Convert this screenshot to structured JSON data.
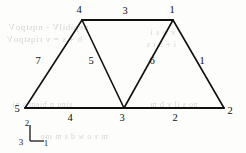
{
  "figure": {
    "background_color": "#fdfdfc",
    "line_color": "#111111",
    "text_color": "#0d0d0d"
  },
  "nodes": [
    {
      "label": "4",
      "x": 82,
      "y": 20,
      "label_x": 79,
      "label_y": 13
    },
    {
      "label": "1",
      "x": 173,
      "y": 20,
      "label_x": 172,
      "label_y": 13
    },
    {
      "label": "5",
      "x": 25,
      "y": 108,
      "label_x": 17,
      "label_y": 112
    },
    {
      "label": "3",
      "x": 124,
      "y": 108,
      "label_x": 122,
      "label_y": 121
    },
    {
      "label": "2",
      "x": 224,
      "y": 108,
      "label_x": 230,
      "label_y": 114
    }
  ],
  "members": [
    {
      "label": "3",
      "from": "4",
      "to": "1",
      "x1": 82,
      "y1": 20,
      "x2": 173,
      "y2": 20,
      "label_x": 125,
      "label_y": 14
    },
    {
      "label": "7",
      "from": "5",
      "to": "4",
      "x1": 25,
      "y1": 108,
      "x2": 82,
      "y2": 20,
      "label_x": 38,
      "label_y": 64
    },
    {
      "label": "5",
      "from": "4",
      "to": "3",
      "x1": 82,
      "y1": 20,
      "x2": 124,
      "y2": 108,
      "label_x": 91,
      "label_y": 64
    },
    {
      "label": "6",
      "from": "3",
      "to": "1",
      "x1": 124,
      "y1": 108,
      "x2": 173,
      "y2": 20,
      "label_x": 152,
      "label_y": 64
    },
    {
      "label": "1",
      "from": "1",
      "to": "2",
      "x1": 173,
      "y1": 20,
      "x2": 224,
      "y2": 108,
      "label_x": 202,
      "label_y": 64
    },
    {
      "label": "4",
      "from": "5",
      "to": "3",
      "x1": 25,
      "y1": 108,
      "x2": 124,
      "y2": 108,
      "label_x": 70,
      "label_y": 121
    },
    {
      "label": "2",
      "from": "3",
      "to": "2",
      "x1": 124,
      "y1": 108,
      "x2": 224,
      "y2": 108,
      "label_x": 175,
      "label_y": 121
    }
  ],
  "axis_triad": {
    "name": "coordinate-triad",
    "origin_x": 30,
    "origin_y": 141,
    "vertical_tip_y": 125,
    "horizontal_tip_x": 44,
    "axis_up": {
      "label": "2",
      "label_x": 27,
      "label_y": 126
    },
    "axis_right": {
      "label": "1",
      "label_x": 46,
      "label_y": 146
    },
    "axis_origin": {
      "label": "3",
      "label_x": 21,
      "label_y": 145
    }
  },
  "bleed_through_text": [
    {
      "text": "nepibilV - nqstpoV",
      "x": 8,
      "y": 22,
      "size": 9
    },
    {
      "text": "h + s = v riqstpoV",
      "x": 6,
      "y": 34,
      "size": 9
    },
    {
      "text": "v w s i",
      "x": 150,
      "y": 28,
      "size": 8
    },
    {
      "text": "i + n r s",
      "x": 146,
      "y": 40,
      "size": 8
    },
    {
      "text": "sinu n biem s ni",
      "x": 12,
      "y": 100,
      "size": 8
    },
    {
      "text": "no s il v b m",
      "x": 150,
      "y": 100,
      "size": 8
    },
    {
      "text": "m v o w d s m ino",
      "x": 40,
      "y": 132,
      "size": 8
    }
  ]
}
